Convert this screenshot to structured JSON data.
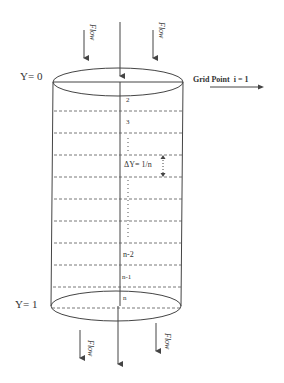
{
  "diagram": {
    "labels": {
      "y_top": "Y= 0",
      "y_bottom": "Y= 1",
      "grid_point": "Grid Point  i = 1",
      "flow": "Flow",
      "node_2": "2",
      "node_3": "3",
      "delta": "ΔY= 1/n",
      "node_n2": "n-2",
      "node_n1": "n-1",
      "node_n": "n"
    },
    "colors": {
      "stroke": "#444444",
      "dash": "#555555",
      "text": "#333333"
    }
  }
}
